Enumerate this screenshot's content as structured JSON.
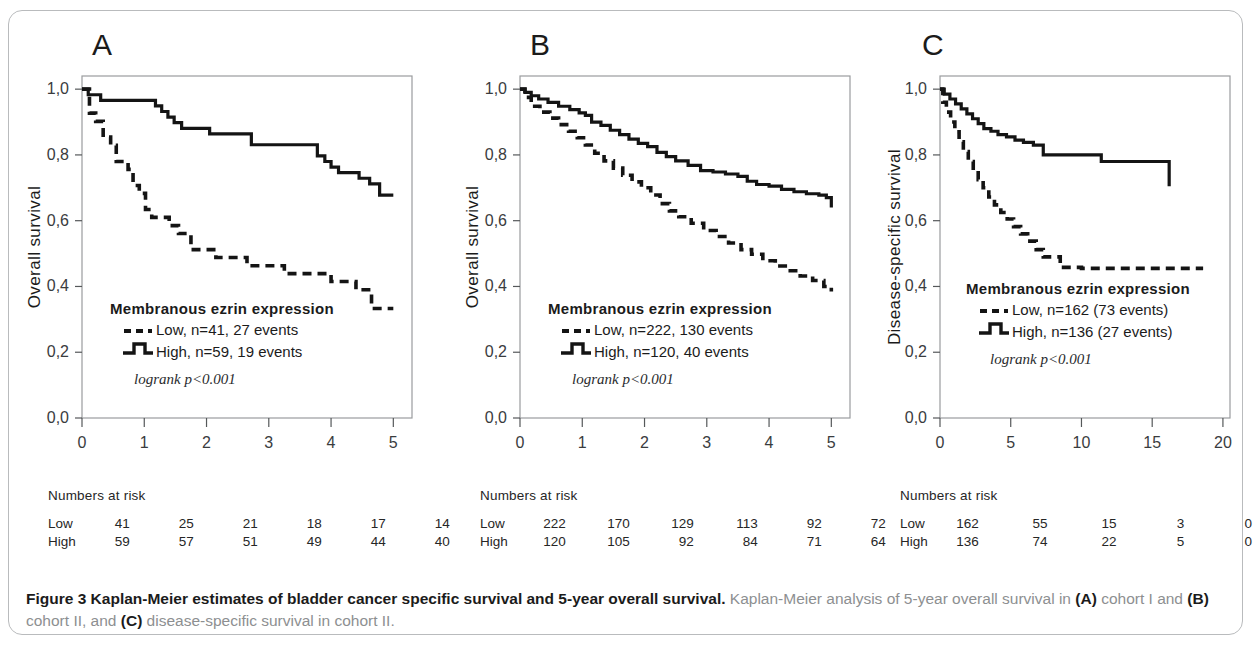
{
  "figure": {
    "caption_bold": "Figure 3 Kaplan-Meier estimates of bladder cancer specific survival and 5-year overall survival.",
    "caption_rest_1": " Kaplan-Meier analysis of 5-year overall survival in ",
    "caption_a": "(A)",
    "caption_rest_2": " cohort I and ",
    "caption_b": "(B)",
    "caption_rest_3": " cohort II, and ",
    "caption_c": "(C)",
    "caption_rest_4": " disease-specific survival in cohort II."
  },
  "panels": {
    "a": {
      "letter": "A",
      "ylabel": "Overall survival",
      "xlabel": "Years from diagnosis",
      "legend_title": "Membranous ezrin expression",
      "legend_low": "Low, n=41, 27 events",
      "legend_high": "High, n=59, 19 events",
      "logrank": "logrank p<0.001",
      "risk_title": "Numbers at risk",
      "risk_rows": [
        {
          "label": "Low",
          "values": [
            "41",
            "25",
            "21",
            "18",
            "17",
            "14"
          ]
        },
        {
          "label": "High",
          "values": [
            "59",
            "57",
            "51",
            "49",
            "44",
            "40"
          ]
        }
      ]
    },
    "b": {
      "letter": "B",
      "ylabel": "Overall survival",
      "xlabel": "Years from diagnosis",
      "legend_title": "Membranous ezrin expression",
      "legend_low": "Low, n=222, 130 events",
      "legend_high": "High, n=120, 40 events",
      "logrank": "logrank p<0.001",
      "risk_title": "Numbers at risk",
      "risk_rows": [
        {
          "label": "Low",
          "values": [
            "222",
            "170",
            "129",
            "113",
            "92",
            "72"
          ]
        },
        {
          "label": "High",
          "values": [
            "120",
            "105",
            "92",
            "84",
            "71",
            "64"
          ]
        }
      ]
    },
    "c": {
      "letter": "C",
      "ylabel": "Disease-specific survival",
      "xlabel": "Years from diagnosis",
      "legend_title": "Membranous ezrin expression",
      "legend_low": "Low, n=162 (73 events)",
      "legend_high": "High, n=136 (27 events)",
      "logrank": "logrank p<0.001",
      "risk_title": "Numbers at risk",
      "risk_rows": [
        {
          "label": "Low",
          "values": [
            "162",
            "55",
            "15",
            "3",
            "0"
          ]
        },
        {
          "label": "High",
          "values": [
            "136",
            "74",
            "22",
            "5",
            "0"
          ]
        }
      ]
    }
  },
  "chart_data": [
    {
      "id": "A",
      "type": "line",
      "title": "A",
      "xlabel": "Years from diagnosis",
      "ylabel": "Overall survival",
      "xlim": [
        0,
        5.3
      ],
      "ylim": [
        0.0,
        1.04
      ],
      "xticks": [
        0,
        1,
        2,
        3,
        4,
        5
      ],
      "xticklabels": [
        "0",
        "1",
        "2",
        "3",
        "4",
        "5"
      ],
      "yticks": [
        0.0,
        0.2,
        0.4,
        0.6,
        0.8,
        1.0
      ],
      "yticklabels": [
        "0,0",
        "0,2",
        "0,4",
        "0,6",
        "0,8",
        "1,0"
      ],
      "grid": false,
      "legend_position": "lower-left-inside",
      "annotations": [
        "Membranous ezrin expression",
        "logrank p<0.001"
      ],
      "series": [
        {
          "name": "High, n=59, 19 events",
          "style": "solid",
          "x": [
            0.0,
            0.1,
            0.18,
            0.3,
            0.55,
            1.05,
            1.18,
            1.28,
            1.38,
            1.48,
            1.6,
            1.72,
            1.85,
            2.05,
            2.45,
            2.6,
            2.72,
            3.65,
            3.78,
            3.9,
            4.0,
            4.12,
            4.3,
            4.45,
            4.62,
            4.78,
            5.0
          ],
          "y": [
            1.0,
            0.983,
            0.983,
            0.966,
            0.966,
            0.966,
            0.949,
            0.932,
            0.915,
            0.898,
            0.881,
            0.881,
            0.881,
            0.864,
            0.864,
            0.864,
            0.831,
            0.831,
            0.797,
            0.78,
            0.763,
            0.746,
            0.746,
            0.729,
            0.712,
            0.678,
            0.678
          ]
        },
        {
          "name": "Low, n=41, 27 events",
          "style": "dashed",
          "x": [
            0.0,
            0.12,
            0.22,
            0.34,
            0.46,
            0.55,
            0.62,
            0.74,
            0.82,
            0.92,
            1.02,
            1.12,
            1.25,
            1.4,
            1.55,
            1.75,
            1.95,
            2.15,
            2.4,
            2.65,
            2.95,
            3.25,
            3.6,
            4.0,
            4.25,
            4.4,
            4.65,
            5.0
          ],
          "y": [
            1.0,
            0.927,
            0.902,
            0.854,
            0.829,
            0.78,
            0.78,
            0.756,
            0.707,
            0.683,
            0.634,
            0.61,
            0.61,
            0.585,
            0.561,
            0.512,
            0.512,
            0.488,
            0.488,
            0.463,
            0.463,
            0.439,
            0.439,
            0.415,
            0.415,
            0.39,
            0.333,
            0.333
          ]
        }
      ]
    },
    {
      "id": "B",
      "type": "line",
      "title": "B",
      "xlabel": "Years from diagnosis",
      "ylabel": "Overall survival",
      "xlim": [
        0,
        5.3
      ],
      "ylim": [
        0.0,
        1.04
      ],
      "xticks": [
        0,
        1,
        2,
        3,
        4,
        5
      ],
      "xticklabels": [
        "0",
        "1",
        "2",
        "3",
        "4",
        "5"
      ],
      "yticks": [
        0.0,
        0.2,
        0.4,
        0.6,
        0.8,
        1.0
      ],
      "yticklabels": [
        "0,0",
        "0,2",
        "0,4",
        "0,6",
        "0,8",
        "1,0"
      ],
      "grid": false,
      "legend_position": "lower-left-inside",
      "annotations": [
        "Membranous ezrin expression",
        "logrank p<0.001"
      ],
      "series": [
        {
          "name": "High, n=120, 40 events",
          "style": "solid",
          "x": [
            0.0,
            0.08,
            0.18,
            0.3,
            0.45,
            0.62,
            0.8,
            0.95,
            1.05,
            1.15,
            1.3,
            1.45,
            1.6,
            1.75,
            1.9,
            2.05,
            2.2,
            2.35,
            2.5,
            2.7,
            2.9,
            3.1,
            3.3,
            3.5,
            3.65,
            3.8,
            4.0,
            4.2,
            4.4,
            4.6,
            4.8,
            4.92,
            5.0
          ],
          "y": [
            1.0,
            0.99,
            0.98,
            0.97,
            0.96,
            0.948,
            0.938,
            0.928,
            0.92,
            0.9,
            0.89,
            0.875,
            0.862,
            0.848,
            0.835,
            0.825,
            0.808,
            0.795,
            0.782,
            0.768,
            0.752,
            0.748,
            0.742,
            0.735,
            0.72,
            0.71,
            0.705,
            0.695,
            0.688,
            0.682,
            0.678,
            0.67,
            0.64
          ]
        },
        {
          "name": "Low, n=222, 130 events",
          "style": "dashed",
          "x": [
            0.0,
            0.08,
            0.18,
            0.32,
            0.48,
            0.62,
            0.78,
            0.92,
            1.05,
            1.2,
            1.35,
            1.5,
            1.65,
            1.8,
            1.95,
            2.1,
            2.25,
            2.4,
            2.55,
            2.75,
            2.95,
            3.15,
            3.35,
            3.55,
            3.72,
            3.9,
            4.1,
            4.3,
            4.5,
            4.7,
            4.88,
            5.0
          ],
          "y": [
            1.0,
            0.975,
            0.948,
            0.93,
            0.912,
            0.892,
            0.872,
            0.852,
            0.83,
            0.805,
            0.782,
            0.76,
            0.738,
            0.718,
            0.7,
            0.678,
            0.652,
            0.63,
            0.612,
            0.592,
            0.57,
            0.552,
            0.532,
            0.512,
            0.498,
            0.478,
            0.462,
            0.448,
            0.432,
            0.418,
            0.4,
            0.385
          ]
        }
      ]
    },
    {
      "id": "C",
      "type": "line",
      "title": "C",
      "xlabel": "Years from diagnosis",
      "ylabel": "Disease-specific survival",
      "xlim": [
        0,
        20.5
      ],
      "ylim": [
        0.0,
        1.04
      ],
      "xticks": [
        0,
        5,
        10,
        15,
        20
      ],
      "xticklabels": [
        "0",
        "5",
        "10",
        "15",
        "20"
      ],
      "yticks": [
        0.0,
        0.2,
        0.4,
        0.6,
        0.8,
        1.0
      ],
      "yticklabels": [
        "0,0",
        "0,2",
        "0,4",
        "0,6",
        "0,8",
        "1,0"
      ],
      "grid": false,
      "legend_position": "lower-left-inside",
      "annotations": [
        "Membranous ezrin expression",
        "logrank p<0.001"
      ],
      "series": [
        {
          "name": "High, n=136 (27 events)",
          "style": "solid",
          "x": [
            0.0,
            0.3,
            0.7,
            1.1,
            1.5,
            1.9,
            2.3,
            2.7,
            3.1,
            3.6,
            4.1,
            4.7,
            5.3,
            5.9,
            6.6,
            7.3,
            8.6,
            11.4,
            16.2
          ],
          "y": [
            1.0,
            0.985,
            0.97,
            0.955,
            0.94,
            0.925,
            0.91,
            0.895,
            0.88,
            0.872,
            0.862,
            0.855,
            0.845,
            0.838,
            0.83,
            0.8,
            0.8,
            0.78,
            0.705
          ]
        },
        {
          "name": "Low, n=162 (73 events)",
          "style": "dashed",
          "x": [
            0.0,
            0.2,
            0.45,
            0.75,
            1.05,
            1.35,
            1.65,
            2.0,
            2.35,
            2.7,
            3.05,
            3.45,
            3.85,
            4.3,
            4.75,
            5.2,
            5.7,
            6.2,
            6.8,
            7.3,
            8.5,
            10.0,
            12.0,
            14.5,
            16.5,
            18.6
          ],
          "y": [
            1.0,
            0.96,
            0.93,
            0.9,
            0.87,
            0.84,
            0.81,
            0.78,
            0.752,
            0.725,
            0.7,
            0.672,
            0.648,
            0.625,
            0.605,
            0.582,
            0.56,
            0.538,
            0.512,
            0.49,
            0.458,
            0.455,
            0.455,
            0.455,
            0.455,
            0.455
          ]
        }
      ]
    }
  ]
}
